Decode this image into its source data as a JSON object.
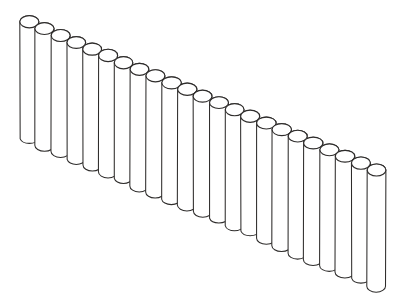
{
  "image": {
    "title": "Row of cylinders line drawing",
    "subject": "array-of-cylindrical-rods",
    "style": "black-and-white line drawing",
    "background_color": "#ffffff",
    "stroke_color": "#2e2c2b",
    "width": 407,
    "height": 301
  },
  "drawing": {
    "description": "A receding row of identical upright cylinders (rods) drawn in perspective, descending from upper-left to lower-right, like a palisade fence or pan flute.",
    "cylinder_count": 23,
    "first_cylinder": {
      "cx": 29,
      "cy": 22
    },
    "last_cylinder": {
      "cx": 376,
      "cy": 170
    },
    "step_x": 15.8,
    "step_y": 6.73,
    "radius_x": 9.5,
    "radius_y": 6.0,
    "body_height": 116,
    "labels": []
  },
  "chart_data": {
    "type": "scatter",
    "xlabel": "",
    "ylabel": "",
    "categories": [],
    "values": []
  }
}
